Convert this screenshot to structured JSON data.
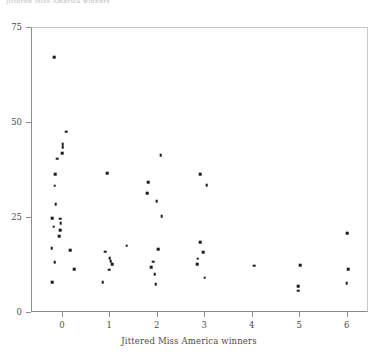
{
  "figure": {
    "top_caption": "Jittered Miss America winners",
    "background_color": "#ffffff",
    "point_color": "#1a1a1a",
    "axis_color": "#8c8c8c",
    "label_color": "#4d4d4d"
  },
  "chart_data": {
    "type": "scatter",
    "title": "",
    "xlabel": "Jittered Miss America winners",
    "ylabel": "",
    "xlim": [
      -0.65,
      6.45
    ],
    "ylim": [
      0,
      75
    ],
    "xticks": [
      0,
      1,
      2,
      3,
      4,
      5,
      6
    ],
    "xtick_labels": [
      "0",
      "1",
      "2",
      "3",
      "4",
      "5",
      "6"
    ],
    "yticks": [
      0,
      25,
      50,
      75
    ],
    "ytick_labels": [
      "0",
      "25",
      "50",
      "75"
    ],
    "grid": false,
    "legend": null,
    "marker": "square",
    "marker_size": 2.6,
    "points": [
      {
        "x": -0.16,
        "y": 67.0
      },
      {
        "x": 0.09,
        "y": 47.4
      },
      {
        "x": 0.02,
        "y": 44.2
      },
      {
        "x": 0.02,
        "y": 43.4
      },
      {
        "x": 0.01,
        "y": 41.8
      },
      {
        "x": -0.1,
        "y": 40.3
      },
      {
        "x": -0.14,
        "y": 36.3
      },
      {
        "x": -0.15,
        "y": 33.2
      },
      {
        "x": -0.13,
        "y": 28.4
      },
      {
        "x": -0.2,
        "y": 24.7
      },
      {
        "x": -0.03,
        "y": 24.5
      },
      {
        "x": -0.02,
        "y": 23.4
      },
      {
        "x": -0.17,
        "y": 22.4
      },
      {
        "x": -0.04,
        "y": 21.6
      },
      {
        "x": -0.05,
        "y": 20.0
      },
      {
        "x": -0.21,
        "y": 16.8
      },
      {
        "x": 0.17,
        "y": 16.3
      },
      {
        "x": -0.15,
        "y": 13.1
      },
      {
        "x": -0.2,
        "y": 7.9
      },
      {
        "x": 0.26,
        "y": 11.2
      },
      {
        "x": 0.95,
        "y": 36.6
      },
      {
        "x": 0.91,
        "y": 15.9
      },
      {
        "x": 1.01,
        "y": 14.2
      },
      {
        "x": 1.03,
        "y": 13.3
      },
      {
        "x": 1.06,
        "y": 12.6
      },
      {
        "x": 1.0,
        "y": 11.1
      },
      {
        "x": 0.86,
        "y": 7.8
      },
      {
        "x": 1.37,
        "y": 17.4
      },
      {
        "x": 1.82,
        "y": 34.2
      },
      {
        "x": 1.8,
        "y": 31.2
      },
      {
        "x": 2.08,
        "y": 41.3
      },
      {
        "x": 2.0,
        "y": 29.1
      },
      {
        "x": 2.1,
        "y": 25.2
      },
      {
        "x": 2.03,
        "y": 16.5
      },
      {
        "x": 1.92,
        "y": 13.2
      },
      {
        "x": 1.88,
        "y": 11.8
      },
      {
        "x": 1.96,
        "y": 10.0
      },
      {
        "x": 1.98,
        "y": 7.3
      },
      {
        "x": 2.92,
        "y": 36.2
      },
      {
        "x": 3.05,
        "y": 33.3
      },
      {
        "x": 2.92,
        "y": 18.3
      },
      {
        "x": 2.98,
        "y": 15.8
      },
      {
        "x": 2.86,
        "y": 14.0
      },
      {
        "x": 2.85,
        "y": 12.6
      },
      {
        "x": 3.01,
        "y": 9.0
      },
      {
        "x": 4.05,
        "y": 12.2
      },
      {
        "x": 5.02,
        "y": 12.3
      },
      {
        "x": 4.98,
        "y": 6.8
      },
      {
        "x": 4.98,
        "y": 5.6
      },
      {
        "x": 6.01,
        "y": 20.8
      },
      {
        "x": 6.03,
        "y": 11.2
      },
      {
        "x": 6.0,
        "y": 7.6
      }
    ]
  }
}
